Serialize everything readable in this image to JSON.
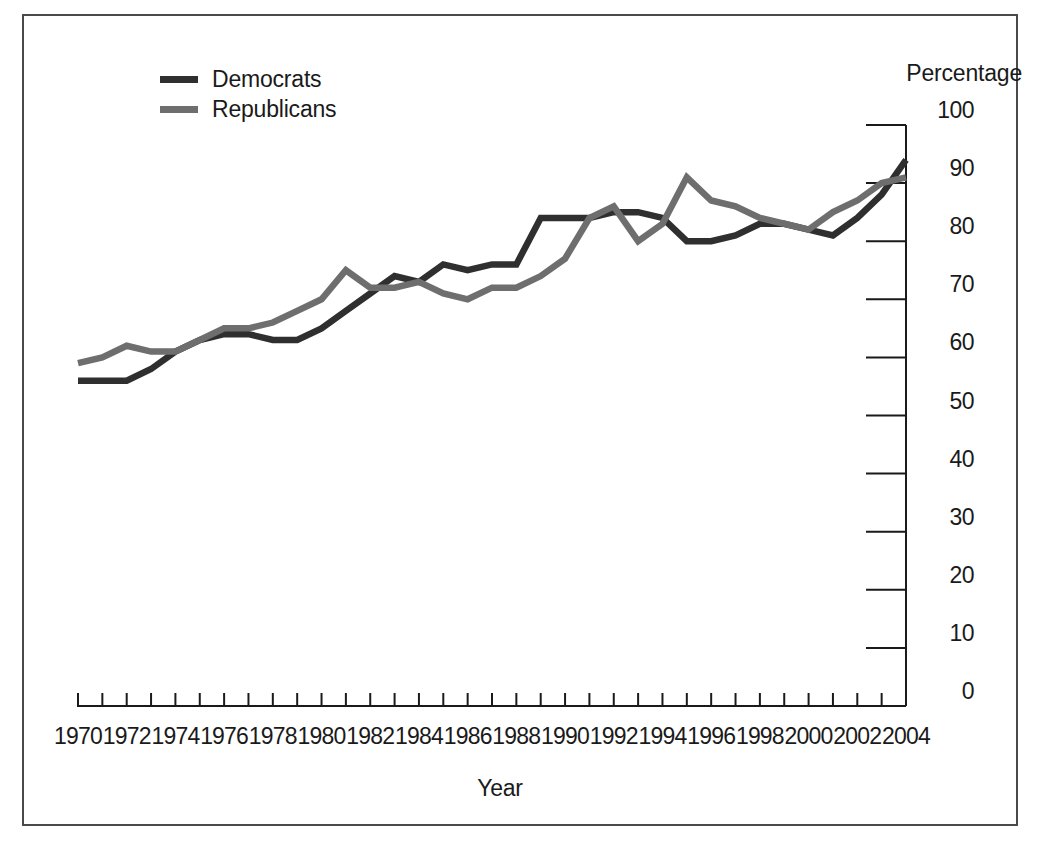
{
  "figure": {
    "background_color": "#ffffff",
    "frame_color": "#4a4a4a"
  },
  "legend": {
    "entries": [
      {
        "label": "Democrats",
        "color": "#2f2f2f"
      },
      {
        "label": "Republicans",
        "color": "#6e6e6e"
      }
    ]
  },
  "axes": {
    "y_title": "Percentage",
    "x_title": "Year",
    "y_ticks": [
      "0",
      "10",
      "20",
      "30",
      "40",
      "50",
      "60",
      "70",
      "80",
      "90",
      "100"
    ],
    "x_ticks": [
      "1970",
      "1972",
      "1974",
      "1976",
      "1978",
      "1980",
      "1982",
      "1984",
      "1986",
      "1988",
      "1990",
      "1992",
      "1994",
      "1996",
      "1998",
      "2000",
      "2002",
      "2004"
    ]
  },
  "chart_data": {
    "type": "line",
    "title": "",
    "subtitle": "",
    "xlabel": "Year",
    "ylabel": "Percentage",
    "xlim": [
      1970,
      2004
    ],
    "ylim": [
      0,
      100
    ],
    "grid": false,
    "legend_position": "top-left",
    "x": [
      1970,
      1971,
      1972,
      1973,
      1974,
      1975,
      1976,
      1977,
      1978,
      1979,
      1980,
      1981,
      1982,
      1983,
      1984,
      1985,
      1986,
      1987,
      1988,
      1989,
      1990,
      1991,
      1992,
      1993,
      1994,
      1995,
      1996,
      1997,
      1998,
      1999,
      2000,
      2001,
      2002,
      2003,
      2004
    ],
    "series": [
      {
        "name": "Democrats",
        "color": "#2f2f2f",
        "values": [
          56,
          56,
          56,
          58,
          61,
          63,
          64,
          64,
          63,
          63,
          65,
          68,
          71,
          74,
          73,
          76,
          75,
          76,
          76,
          84,
          84,
          84,
          85,
          85,
          84,
          80,
          80,
          81,
          83,
          83,
          82,
          81,
          84,
          88,
          94
        ]
      },
      {
        "name": "Republicans",
        "color": "#6e6e6e",
        "values": [
          59,
          60,
          62,
          61,
          61,
          63,
          65,
          65,
          66,
          68,
          70,
          75,
          72,
          72,
          73,
          71,
          70,
          72,
          72,
          74,
          77,
          84,
          86,
          80,
          83,
          91,
          87,
          86,
          84,
          83,
          82,
          85,
          87,
          90,
          91
        ]
      }
    ]
  },
  "geometry": {
    "plot_left": 78,
    "plot_right": 906,
    "y_top_px": 125,
    "y_bottom_px": 706
  }
}
